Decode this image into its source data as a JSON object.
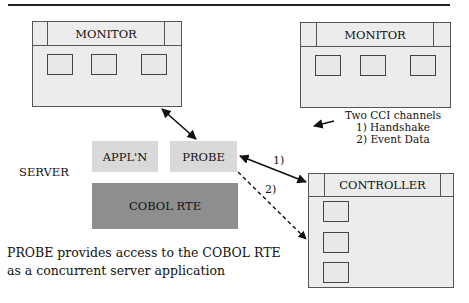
{
  "diagram": {
    "monitor_left": {
      "title": "MONITOR",
      "slot_count": 3
    },
    "monitor_right": {
      "title": "MONITOR",
      "slot_count": 3
    },
    "server": {
      "label": "SERVER",
      "appln": "APPL'N",
      "probe": "PROBE",
      "cobol_rte": "COBOL RTE"
    },
    "controller": {
      "title": "CONTROLLER",
      "slot_count": 3
    },
    "channels_note": {
      "title": "Two CCI channels",
      "items": [
        "1) Handshake",
        "2) Event Data"
      ]
    },
    "arrow_labels": {
      "handshake": "1)",
      "event_data": "2)"
    },
    "caption": {
      "line1": "PROBE provides access to the COBOL RTE",
      "line2": "as a concurrent server application"
    },
    "colors": {
      "window_fill": "#ececec",
      "light_block": "#d9d9d9",
      "dark_block": "#8e8e8e",
      "stroke": "#111111"
    }
  }
}
